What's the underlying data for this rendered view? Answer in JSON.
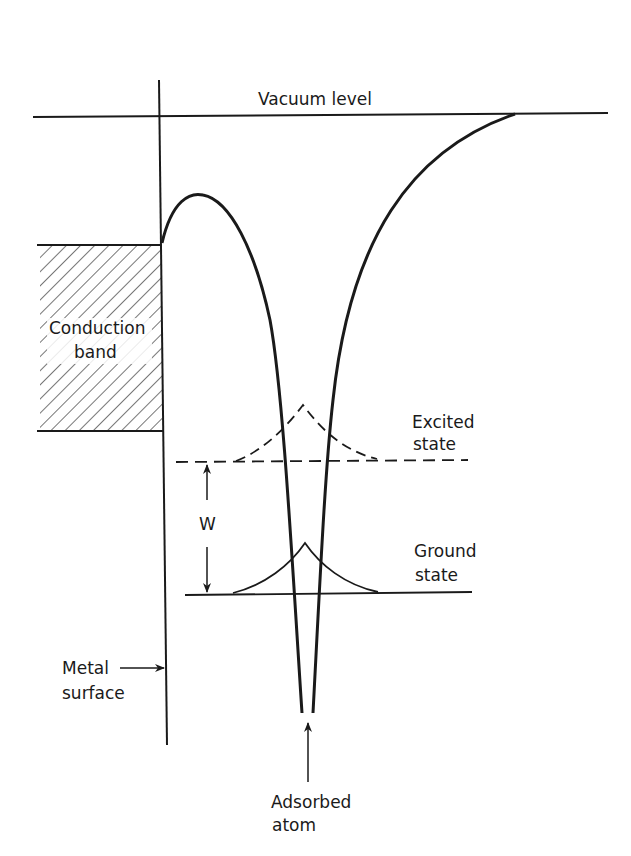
{
  "diagram": {
    "type": "energy-level-diagram",
    "labels": {
      "vacuum_level": "Vacuum level",
      "conduction_band_line1": "Conduction",
      "conduction_band_line2": "band",
      "excited_state_line1": "Excited",
      "excited_state_line2": "state",
      "ground_state_line1": "Ground",
      "ground_state_line2": "state",
      "energy_gap": "W",
      "metal_surface_line1": "Metal",
      "metal_surface_line2": "surface",
      "adsorbed_atom_line1": "Adsorbed",
      "adsorbed_atom_line2": "atom"
    },
    "colors": {
      "ink": "#1a1a1a",
      "background": "#ffffff"
    }
  }
}
